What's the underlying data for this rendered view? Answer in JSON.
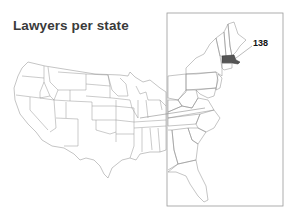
{
  "title": "Lawyers per state",
  "highlight": {
    "state": "Massachusetts",
    "value_label": "138",
    "fill_color": "#555555"
  },
  "colors": {
    "border": "#8a8a8a",
    "inset_box": "#9a9a9a",
    "title": "#3a3a3a"
  },
  "map": {
    "main": "Contiguous United States outline map",
    "inset": "Enlarged East Coast / New England inset"
  }
}
